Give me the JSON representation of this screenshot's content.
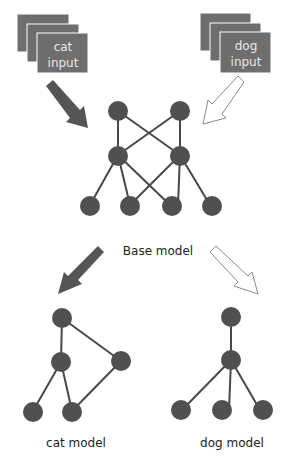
{
  "colors": {
    "node": "#505050",
    "edge": "#484848",
    "input_box": "#6e6e6e",
    "input_box_border": "#5c5c5c",
    "input_text": "#ececec",
    "arrow_dark": "#555555",
    "arrow_light_fill": "#ffffff",
    "arrow_light_stroke": "#8a8a8a",
    "label": "#222222"
  },
  "inputs": {
    "cat": {
      "line1": "cat",
      "line2": "input"
    },
    "dog": {
      "line1": "dog",
      "line2": "input"
    }
  },
  "base_model": {
    "label": "Base model",
    "layers": [
      [
        [
          118,
          111
        ],
        [
          180,
          111
        ]
      ],
      [
        [
          118,
          155
        ],
        [
          180,
          155
        ]
      ],
      [
        [
          90,
          205
        ],
        [
          130,
          205
        ],
        [
          170,
          205
        ],
        [
          210,
          205
        ]
      ]
    ]
  },
  "cat_model": {
    "label": "cat model"
  },
  "dog_model": {
    "label": "dog model"
  }
}
